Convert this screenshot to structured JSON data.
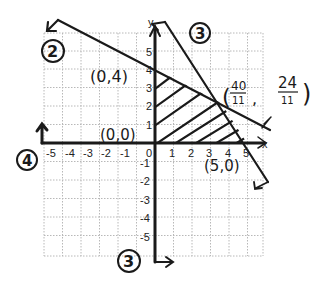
{
  "graph": {
    "axis_labels": {
      "x": "x",
      "y": "y"
    },
    "x_ticks": [
      "-5",
      "-4",
      "-3",
      "-2",
      "-1",
      "0",
      "1",
      "2",
      "3",
      "4",
      "5"
    ],
    "y_ticks_positive": [
      "1",
      "2",
      "3",
      "4",
      "5"
    ],
    "y_ticks_negative": [
      "-1",
      "-2",
      "-3",
      "-4",
      "-5"
    ],
    "grid": {
      "min": -5,
      "max": 5,
      "style": "dotted"
    },
    "colors": {
      "ink": "#1a1a1a",
      "grid": "#b0b0b0",
      "background": "#ffffff"
    }
  },
  "annotations": {
    "point_0_4": "(0,4)",
    "point_0_0": "(0,0)",
    "point_5_0": "(5,0)",
    "intersection_open": "(",
    "intersection_x_num": "40",
    "intersection_x_den": "11",
    "intersection_comma": ",",
    "intersection_y_num": "24",
    "intersection_y_den": "11",
    "intersection_close": ")"
  },
  "constraint_labels": {
    "line_2": "2",
    "line_3_top": "3",
    "line_3_bottom": "3",
    "line_4": "4"
  },
  "feasible_region": {
    "vertices": [
      "(0,0)",
      "(0,4)",
      "(40/11, 24/11)",
      "(5,0)"
    ],
    "fill": "hatched"
  }
}
